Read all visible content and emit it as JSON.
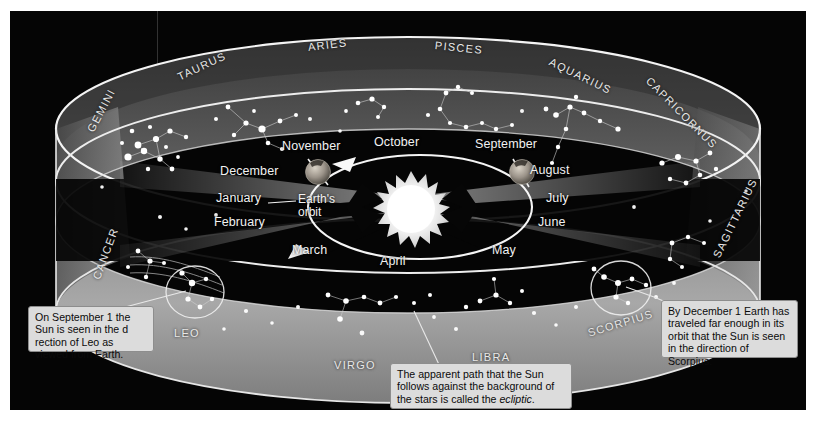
{
  "figure": {
    "background_color": "#050505",
    "plate_rect": [
      10,
      11,
      796,
      399
    ]
  },
  "sun": {
    "label": "Sun",
    "color": "#ffffff"
  },
  "earth_orbit": {
    "label_line1": "Earth's",
    "label_line2": "orbit",
    "direction": "counterclockwise"
  },
  "earth_positions": [
    {
      "name": "earth-november",
      "month": "November",
      "x": 308,
      "y": 160
    },
    {
      "name": "earth-september",
      "month": "September",
      "x": 512,
      "y": 160
    }
  ],
  "months": [
    {
      "label": "November",
      "x": 288,
      "y": 136
    },
    {
      "label": "October",
      "x": 380,
      "y": 132
    },
    {
      "label": "September",
      "x": 482,
      "y": 134
    },
    {
      "label": "December",
      "x": 228,
      "y": 161
    },
    {
      "label": "August",
      "x": 536,
      "y": 160
    },
    {
      "label": "January",
      "x": 223,
      "y": 188
    },
    {
      "label": "July",
      "x": 549,
      "y": 188
    },
    {
      "label": "February",
      "x": 222,
      "y": 212
    },
    {
      "label": "June",
      "x": 543,
      "y": 212
    },
    {
      "label": "March",
      "x": 298,
      "y": 240
    },
    {
      "label": "April",
      "x": 385,
      "y": 251
    },
    {
      "label": "May",
      "x": 494,
      "y": 240
    }
  ],
  "constellations": [
    {
      "label": "GEMINI",
      "x": 88,
      "y": 120,
      "rotate": -62
    },
    {
      "label": "TAURUS",
      "x": 172,
      "y": 66,
      "rotate": -26
    },
    {
      "label": "ARIES",
      "x": 305,
      "y": 38,
      "rotate": -8
    },
    {
      "label": "PISCES",
      "x": 437,
      "y": 38,
      "rotate": 6
    },
    {
      "label": "AQUARIUS",
      "x": 556,
      "y": 55,
      "rotate": 25
    },
    {
      "label": "CAPRICORNUS",
      "x": 654,
      "y": 76,
      "rotate": 44
    },
    {
      "label": "SAGITTARIUS",
      "x": 718,
      "y": 250,
      "rotate": -64
    },
    {
      "label": "SCORPIUS",
      "x": 590,
      "y": 325,
      "rotate": -17
    },
    {
      "label": "LIBRA",
      "x": 474,
      "y": 349,
      "rotate": 0
    },
    {
      "label": "VIRGO",
      "x": 336,
      "y": 358,
      "rotate": 0
    },
    {
      "label": "LEO",
      "x": 175,
      "y": 325,
      "rotate": 0
    },
    {
      "label": "CANCER",
      "x": 93,
      "y": 274,
      "rotate": -70
    }
  ],
  "captions": [
    {
      "name": "caption-leo",
      "text": "On September 1 the Sun is seen in the d rection of Leo as viewed from Earth.",
      "x": 28,
      "y": 306,
      "w": 126,
      "h": 44
    },
    {
      "name": "caption-ecliptic",
      "text_before": "The apparent path that the Sun follows against the background of the stars is called the ",
      "italic_word": "ecliptic",
      "text_after": ".",
      "x": 390,
      "y": 363,
      "w": 180,
      "h": 44
    },
    {
      "name": "caption-scorpius",
      "text": "By December 1 Earth has traveled far enough in its orbit that the Sun is seen in the direction of Scorpius.",
      "x": 661,
      "y": 300,
      "w": 137,
      "h": 56
    }
  ]
}
